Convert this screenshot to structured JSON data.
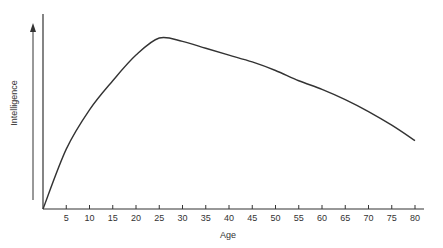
{
  "chart_data": {
    "type": "line",
    "title": "",
    "xlabel": "Age",
    "ylabel": "Intelligence",
    "x": [
      0,
      5,
      10,
      15,
      20,
      25,
      30,
      35,
      40,
      45,
      50,
      55,
      60,
      65,
      70,
      75,
      80
    ],
    "series": [
      {
        "name": "Intelligence",
        "values": [
          0,
          35,
          58,
          75,
          90,
          100,
          98,
          94,
          90,
          86,
          81,
          75,
          70,
          64,
          57,
          49,
          40
        ]
      }
    ],
    "xticks": [
      "5",
      "10",
      "15",
      "20",
      "25",
      "30",
      "35",
      "40",
      "45",
      "50",
      "55",
      "60",
      "65",
      "70",
      "75",
      "80"
    ],
    "xlim": [
      0,
      80
    ],
    "ylim": [
      0,
      100
    ],
    "grid": false,
    "legend": "none"
  }
}
